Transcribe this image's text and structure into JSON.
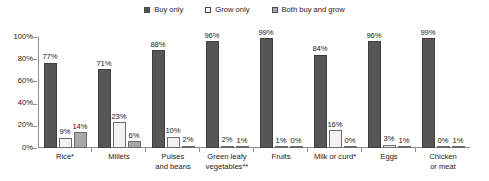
{
  "chart_data": {
    "type": "bar",
    "title": "",
    "subtitle": "",
    "xlabel": "",
    "ylabel": "",
    "ylim": [
      0,
      100
    ],
    "y_ticks": [
      "0%",
      "20%",
      "40%",
      "60%",
      "80%",
      "100%"
    ],
    "grid": false,
    "legend_position": "top-center",
    "categories": [
      "Rice*",
      "Millets",
      "Pulses\nand beans",
      "Green leafy\nvegetables**",
      "Fruits",
      "Milk or curd*",
      "Eggs",
      "Chicken\nor meat"
    ],
    "series": [
      {
        "name": "Buy only",
        "color": "#565656",
        "values": [
          77,
          71,
          88,
          96,
          99,
          84,
          96,
          99
        ],
        "labels": [
          "77%",
          "71%",
          "88%",
          "96%",
          "99%",
          "84%",
          "96%",
          "99%"
        ]
      },
      {
        "name": "Grow only",
        "color": "#f2f2f2",
        "values": [
          9,
          23,
          10,
          2,
          1,
          16,
          3,
          0
        ],
        "labels": [
          "9%",
          "23%",
          "10%",
          "2%",
          "1%",
          "16%",
          "3%",
          "0%"
        ]
      },
      {
        "name": "Both buy and grow",
        "color": "#a8a8a8",
        "values": [
          14,
          6,
          2,
          1,
          0,
          0,
          1,
          1
        ],
        "labels": [
          "14%",
          "6%",
          "2%",
          "1%",
          "0%",
          "0%",
          "1%",
          "1%"
        ]
      }
    ]
  },
  "legend": {
    "items": [
      {
        "label": "Buy only",
        "swatch": "legend-swatch-buy-only"
      },
      {
        "label": "Grow only",
        "swatch": "legend-swatch-grow-only"
      },
      {
        "label": "Both buy and grow",
        "swatch": "legend-swatch-both-buy-and-grow"
      }
    ]
  },
  "axis": {
    "y_ticks": [
      "100%",
      "80%",
      "60%",
      "40%",
      "20%",
      "0%"
    ]
  }
}
